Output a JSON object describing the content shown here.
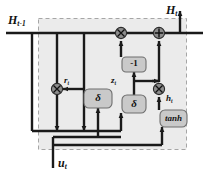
{
  "figure": {
    "kind": "gru-cell-block-diagram",
    "background": "#ffffff",
    "cell_fill": "#ebebeb",
    "cell_border": "#9a9a9a",
    "node_fill": "#8c8c8c",
    "box_fill": "#c9c9c9",
    "box_border": "#6e6e6e",
    "wire_color": "#1a1a1a"
  },
  "labels": {
    "hidden_prev": {
      "base": "H",
      "sub": "t-1"
    },
    "hidden_out": {
      "base": "H",
      "sub": "t"
    },
    "input": {
      "base": "u",
      "sub": "t"
    },
    "reset_gate": {
      "base": "r",
      "sub": "t"
    },
    "update_gate": {
      "base": "z",
      "sub": "t"
    },
    "candidate": {
      "base": "h",
      "sub": "t"
    }
  },
  "blocks": [
    {
      "id": "sigma-reset",
      "label": "δ",
      "x": 84,
      "y": 89,
      "w": 28,
      "h": 19
    },
    {
      "id": "negate",
      "label": "-1",
      "x": 122,
      "y": 57,
      "w": 24,
      "h": 15
    },
    {
      "id": "sigma-update",
      "label": "δ",
      "x": 122,
      "y": 95,
      "w": 24,
      "h": 18
    },
    {
      "id": "tanh",
      "label": "tanh",
      "x": 160,
      "y": 110,
      "w": 27,
      "h": 17
    }
  ],
  "operators": [
    {
      "id": "mul-reset",
      "symbol": "×",
      "x": 57,
      "y": 89
    },
    {
      "id": "mul-forget",
      "symbol": "×",
      "x": 121,
      "y": 33
    },
    {
      "id": "add-merge",
      "symbol": "+",
      "x": 159,
      "y": 33
    },
    {
      "id": "mul-candidate",
      "symbol": "×",
      "x": 159,
      "y": 89
    }
  ]
}
